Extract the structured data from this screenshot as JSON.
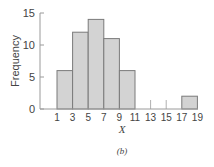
{
  "chart_data": {
    "type": "bar",
    "subtype": "histogram",
    "title": "",
    "xlabel": "X",
    "ylabel": "Frequency",
    "caption": "(b)",
    "bin_edges": [
      1,
      3,
      5,
      7,
      9,
      11,
      13,
      15,
      17,
      19
    ],
    "categories": [
      "1-3",
      "3-5",
      "5-7",
      "7-9",
      "9-11",
      "11-13",
      "13-15",
      "15-17",
      "17-19"
    ],
    "values": [
      6,
      12,
      14,
      11,
      6,
      0,
      0,
      0,
      2
    ],
    "xticks": [
      "1",
      "3",
      "5",
      "7",
      "9",
      "11",
      "13",
      "15",
      "17",
      "19"
    ],
    "yticks": [
      0,
      5,
      10,
      15
    ],
    "ylim": [
      0,
      15
    ],
    "xlim": [
      1,
      19
    ],
    "grid": false,
    "legend": null,
    "colors": {
      "bar_fill": "#d3d3d3",
      "bar_edge": "#7a7a7a",
      "axis": "#9a9a9a",
      "text": "#444444"
    }
  }
}
